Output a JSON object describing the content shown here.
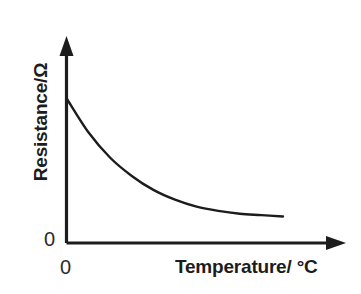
{
  "chart_data": {
    "type": "line",
    "title": "",
    "xlabel": "Temperature/ °C",
    "ylabel": "Resistance/Ω",
    "x_tick_labels": [
      "0"
    ],
    "y_tick_labels": [
      "0"
    ],
    "grid": false,
    "legend": false,
    "axis_style": "arrow-headed open axes",
    "series": [
      {
        "name": "Thermistor resistance vs temperature",
        "description": "Resistance falls steeply at low temperature then levels off asymptotically (negative temperature coefficient).",
        "x": [
          0,
          10,
          20,
          30,
          40,
          50,
          60,
          70,
          80,
          90,
          100
        ],
        "y": [
          100,
          76,
          58,
          45,
          35,
          28,
          23,
          20,
          18,
          17,
          16
        ]
      }
    ],
    "xlim": [
      0,
      100
    ],
    "ylim": [
      0,
      120
    ],
    "colors": {
      "curve": "#1c1c1c",
      "axis": "#1c1c1c",
      "background": "#ffffff",
      "text": "#1c1c1c"
    }
  }
}
